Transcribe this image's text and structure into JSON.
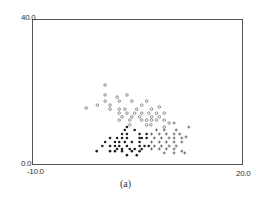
{
  "chart_data": {
    "type": "scatter",
    "title": "",
    "caption": "(a)",
    "xlabel": "",
    "ylabel": "",
    "xlim": [
      -10.0,
      20.0
    ],
    "ylim": [
      0.0,
      40.0
    ],
    "x_tick_labels": [
      "-10.0",
      "20.0"
    ],
    "y_tick_labels": [
      "0.0",
      "40.0"
    ],
    "grid": false,
    "legend": null,
    "series": [
      {
        "name": "open-circle",
        "marker": "o",
        "points": [
          [
            0.4,
            21.9
          ],
          [
            0.4,
            19.2
          ],
          [
            2.1,
            18.6
          ],
          [
            3.5,
            19.2
          ],
          [
            0.4,
            17.5
          ],
          [
            -0.7,
            16.4
          ],
          [
            1.1,
            16.4
          ],
          [
            2.4,
            17.5
          ],
          [
            4.2,
            17.5
          ],
          [
            5.6,
            16.4
          ],
          [
            6.3,
            17.5
          ],
          [
            -2.3,
            15.6
          ],
          [
            1.1,
            15.3
          ],
          [
            2.4,
            15.3
          ],
          [
            3.2,
            15.3
          ],
          [
            4.9,
            15.3
          ],
          [
            7.0,
            15.3
          ],
          [
            8.1,
            15.9
          ],
          [
            2.4,
            14.2
          ],
          [
            3.5,
            14.2
          ],
          [
            4.6,
            14.2
          ],
          [
            5.6,
            14.2
          ],
          [
            6.6,
            14.2
          ],
          [
            7.7,
            14.2
          ],
          [
            8.8,
            14.2
          ],
          [
            2.8,
            13.2
          ],
          [
            4.2,
            13.2
          ],
          [
            5.3,
            13.2
          ],
          [
            7.0,
            13.2
          ],
          [
            8.1,
            13.2
          ],
          [
            2.4,
            12.3
          ],
          [
            3.9,
            12.3
          ],
          [
            5.6,
            12.3
          ],
          [
            6.3,
            12.3
          ],
          [
            7.0,
            12.3
          ],
          [
            7.7,
            12.3
          ],
          [
            8.8,
            12.3
          ],
          [
            9.5,
            11.5
          ],
          [
            3.9,
            11.0
          ],
          [
            6.3,
            11.0
          ],
          [
            6.9,
            11.0
          ],
          [
            8.8,
            10.4
          ]
        ]
      },
      {
        "name": "filled-dot",
        "marker": "•",
        "points": [
          [
            3.2,
            9.6
          ],
          [
            3.5,
            10.4
          ],
          [
            4.6,
            9.6
          ],
          [
            2.8,
            8.5
          ],
          [
            3.5,
            8.5
          ],
          [
            5.3,
            8.5
          ],
          [
            6.3,
            8.5
          ],
          [
            1.1,
            7.4
          ],
          [
            2.1,
            7.4
          ],
          [
            2.8,
            7.4
          ],
          [
            3.5,
            7.4
          ],
          [
            5.3,
            7.4
          ],
          [
            5.6,
            7.4
          ],
          [
            6.3,
            7.4
          ],
          [
            0.4,
            6.3
          ],
          [
            1.8,
            6.3
          ],
          [
            2.4,
            6.3
          ],
          [
            3.2,
            6.3
          ],
          [
            4.2,
            6.3
          ],
          [
            5.3,
            6.3
          ],
          [
            0.0,
            5.2
          ],
          [
            1.1,
            5.2
          ],
          [
            1.8,
            5.2
          ],
          [
            2.4,
            5.2
          ],
          [
            3.5,
            5.2
          ],
          [
            5.3,
            5.2
          ],
          [
            6.0,
            5.2
          ],
          [
            6.6,
            5.2
          ],
          [
            2.1,
            4.4
          ],
          [
            2.8,
            4.4
          ],
          [
            3.9,
            4.4
          ],
          [
            4.6,
            4.4
          ],
          [
            5.6,
            4.4
          ],
          [
            -0.8,
            3.8
          ],
          [
            1.1,
            3.8
          ],
          [
            1.8,
            3.8
          ],
          [
            2.8,
            3.8
          ],
          [
            4.2,
            3.8
          ],
          [
            5.3,
            3.8
          ],
          [
            3.5,
            2.7
          ],
          [
            4.9,
            2.7
          ]
        ]
      },
      {
        "name": "plus",
        "marker": "+",
        "points": [
          [
            10.2,
            11.5
          ],
          [
            12.3,
            10.4
          ],
          [
            7.7,
            9.6
          ],
          [
            8.8,
            9.6
          ],
          [
            10.5,
            9.6
          ],
          [
            7.0,
            8.5
          ],
          [
            8.1,
            8.5
          ],
          [
            9.1,
            8.5
          ],
          [
            10.2,
            8.5
          ],
          [
            11.0,
            8.5
          ],
          [
            7.4,
            7.4
          ],
          [
            8.4,
            7.4
          ],
          [
            9.5,
            7.4
          ],
          [
            10.2,
            7.4
          ],
          [
            11.3,
            7.4
          ],
          [
            11.9,
            7.7
          ],
          [
            7.0,
            6.3
          ],
          [
            8.1,
            6.3
          ],
          [
            9.1,
            6.3
          ],
          [
            10.2,
            6.3
          ],
          [
            11.3,
            6.3
          ],
          [
            7.4,
            5.2
          ],
          [
            8.4,
            5.2
          ],
          [
            9.5,
            5.2
          ],
          [
            10.5,
            5.2
          ],
          [
            7.0,
            4.4
          ],
          [
            8.1,
            4.4
          ],
          [
            9.1,
            4.4
          ],
          [
            10.2,
            4.4
          ],
          [
            11.3,
            3.8
          ],
          [
            8.8,
            3.3
          ],
          [
            10.2,
            3.3
          ],
          [
            11.7,
            3.3
          ]
        ]
      }
    ]
  }
}
